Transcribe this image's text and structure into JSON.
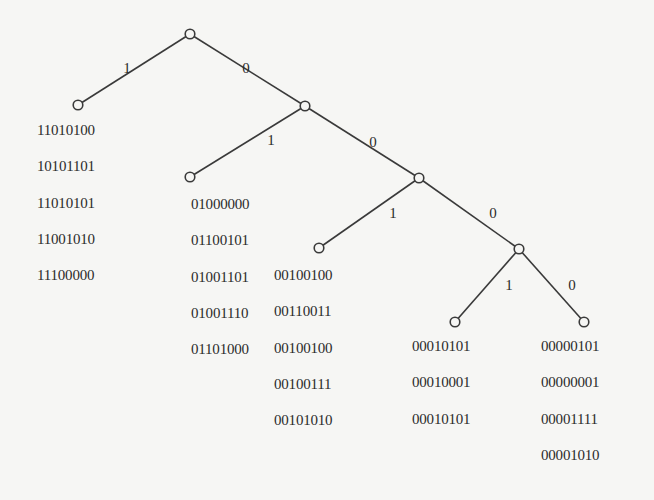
{
  "diagram": {
    "type": "binary-prefix-tree",
    "nodes": [
      {
        "id": "root"
      },
      {
        "id": "n1",
        "parent": "root",
        "edge_label": "1"
      },
      {
        "id": "n0",
        "parent": "root",
        "edge_label": "0"
      },
      {
        "id": "n01",
        "parent": "n0",
        "edge_label": "1"
      },
      {
        "id": "n00",
        "parent": "n0",
        "edge_label": "0"
      },
      {
        "id": "n001",
        "parent": "n00",
        "edge_label": "1"
      },
      {
        "id": "n000",
        "parent": "n00",
        "edge_label": "0"
      },
      {
        "id": "n0001",
        "parent": "n000",
        "edge_label": "1"
      },
      {
        "id": "n0000",
        "parent": "n000",
        "edge_label": "0"
      }
    ],
    "leaf_codes": [
      {
        "leaf": "n1",
        "codes": [
          "11010100",
          "10101101",
          "11010101",
          "11001010",
          "11100000"
        ]
      },
      {
        "leaf": "n01",
        "codes": [
          "01000000",
          "01100101",
          "01001101",
          "01001110",
          "01101000"
        ]
      },
      {
        "leaf": "n001",
        "codes": [
          "00100100",
          "00110011",
          "00100100",
          "00100111",
          "00101010"
        ]
      },
      {
        "leaf": "n0001",
        "codes": [
          "00010101",
          "00010001",
          "00010101"
        ]
      },
      {
        "leaf": "n0000",
        "codes": [
          "00000101",
          "00000001",
          "00001111",
          "00001010"
        ]
      }
    ]
  }
}
